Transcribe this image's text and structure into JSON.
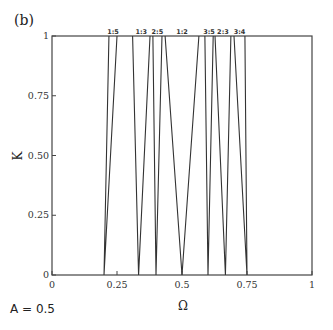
{
  "panel_label": "(b)",
  "parameter_text": "A = 0.5",
  "chart_data": {
    "type": "line",
    "title": "",
    "xlabel": "Ω",
    "ylabel": "K",
    "xlim": [
      0,
      1
    ],
    "ylim": [
      0,
      1
    ],
    "grid": false,
    "xticks": [
      "0",
      "0.25",
      "0.5",
      "0.75",
      "1"
    ],
    "yticks": [
      "0",
      "0.25",
      "0.50",
      "0.75",
      "1"
    ],
    "annotation": "A = 0.5",
    "series": [
      {
        "name": "1:5",
        "tip": 0.2,
        "edges_at_K1": [
          0.219,
          0.25
        ]
      },
      {
        "name": "1:3",
        "tip": 0.333,
        "edges_at_K1": [
          0.31,
          0.377
        ]
      },
      {
        "name": "2:5",
        "tip": 0.4,
        "edges_at_K1": [
          0.388,
          0.423
        ]
      },
      {
        "name": "1:2",
        "tip": 0.5,
        "edges_at_K1": [
          0.435,
          0.565
        ]
      },
      {
        "name": "3:5",
        "tip": 0.6,
        "edges_at_K1": [
          0.588,
          0.62
        ]
      },
      {
        "name": "2:3",
        "tip": 0.667,
        "edges_at_K1": [
          0.627,
          0.688
        ]
      },
      {
        "name": "3:4",
        "tip": 0.75,
        "edges_at_K1": [
          0.7,
          0.742
        ]
      }
    ]
  }
}
